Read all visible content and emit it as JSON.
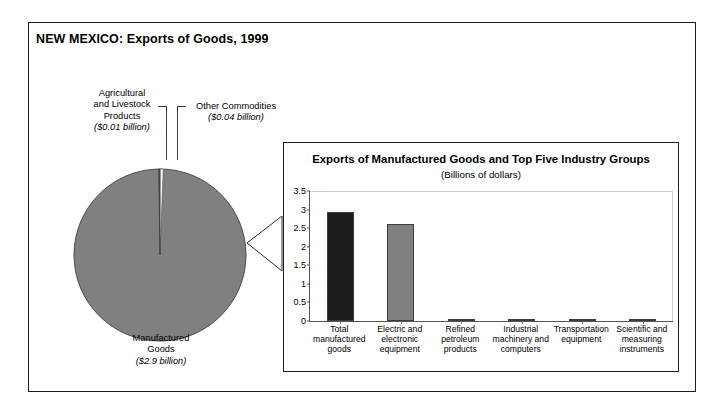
{
  "figure": {
    "title": "NEW MEXICO: Exports of Goods, 1999"
  },
  "pie": {
    "labels": {
      "agricultural": {
        "name": "Agricultural\nand Livestock\nProducts",
        "name_l1": "Agricultural",
        "name_l2": "and Livestock",
        "name_l3": "Products",
        "value_text": "($0.01 billion)"
      },
      "other": {
        "name_l1": "Other Commodities",
        "value_text": "($0.04 billion)"
      },
      "manufactured": {
        "name_l1": "Manufactured",
        "name_l2": "Goods",
        "value_text": "($2.9 billion)"
      }
    }
  },
  "inset": {
    "title": "Exports of Manufactured Goods and Top Five Industry Groups",
    "subtitle": "(Billions of dollars)"
  },
  "chart_data": [
    {
      "type": "pie",
      "title": "NEW MEXICO: Exports of Goods, 1999",
      "unit": "Billions of dollars",
      "labels": [
        "Manufactured Goods",
        "Other Commodities",
        "Agricultural and Livestock Products"
      ],
      "values": [
        2.9,
        0.04,
        0.01
      ],
      "value_texts": [
        "($2.9 billion)",
        "($0.04 billion)",
        "($0.01 billion)"
      ],
      "colors": [
        "#808080",
        "#ffffff",
        "#4d4d4d"
      ],
      "legend": "none"
    },
    {
      "type": "bar",
      "title": "Exports of Manufactured Goods and Top Five Industry Groups",
      "subtitle": "(Billions of dollars)",
      "xlabel": "",
      "ylabel": "",
      "ylim": [
        0,
        3.5
      ],
      "yticks": [
        0,
        0.5,
        1,
        1.5,
        2,
        2.5,
        3,
        3.5
      ],
      "ytick_labels": [
        "0",
        "0.5",
        "1",
        "1.5",
        "2",
        "2.5",
        "3",
        "3.5"
      ],
      "grid": false,
      "legend": "none",
      "categories": [
        "Total manufactured goods",
        "Electric and electronic equipment",
        "Refined petroleum products",
        "Industrial machinery and computers",
        "Transportation equipment",
        "Scientific and measuring instruments"
      ],
      "category_lines": [
        [
          "Total",
          "manufactured",
          "goods"
        ],
        [
          "Electric and",
          "electronic",
          "equipment"
        ],
        [
          "Refined",
          "petroleum",
          "products"
        ],
        [
          "Industrial",
          "machinery and",
          "computers"
        ],
        [
          "Transportation",
          "equipment"
        ],
        [
          "Scientific and",
          "measuring",
          "instruments"
        ]
      ],
      "values": [
        2.93,
        2.6,
        0.06,
        0.05,
        0.05,
        0.05
      ],
      "bar_colors": [
        "#1c1c1c",
        "#808080",
        "#808080",
        "#808080",
        "#808080",
        "#808080"
      ]
    }
  ]
}
